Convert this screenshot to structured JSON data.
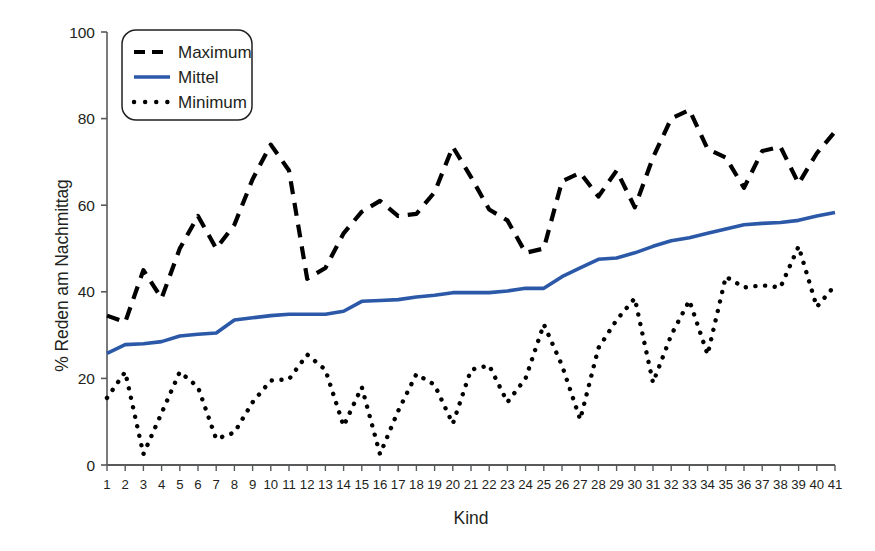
{
  "chart_data": {
    "type": "line",
    "title": "",
    "xlabel": "Kind",
    "ylabel": "% Reden am Nachmittag",
    "xlim": [
      1,
      41
    ],
    "ylim": [
      0,
      100
    ],
    "grid": false,
    "legend_position": "top-left",
    "x": [
      1,
      2,
      3,
      4,
      5,
      6,
      7,
      8,
      9,
      10,
      11,
      12,
      13,
      14,
      15,
      16,
      17,
      18,
      19,
      20,
      21,
      22,
      23,
      24,
      25,
      26,
      27,
      28,
      29,
      30,
      31,
      32,
      33,
      34,
      35,
      36,
      37,
      38,
      39,
      40,
      41
    ],
    "xtick_labels": [
      "1",
      "2",
      "3",
      "4",
      "5",
      "6",
      "7",
      "8",
      "9",
      "10",
      "11",
      "12",
      "13",
      "14",
      "15",
      "16",
      "17",
      "18",
      "19",
      "20",
      "21",
      "22",
      "23",
      "24",
      "25",
      "26",
      "27",
      "28",
      "29",
      "30",
      "31",
      "32",
      "33",
      "34",
      "35",
      "36",
      "37",
      "38",
      "39",
      "40",
      "41"
    ],
    "ytick_labels": [
      "0",
      "20",
      "40",
      "60",
      "80",
      "100"
    ],
    "ytick_values": [
      0,
      20,
      40,
      60,
      80,
      100
    ],
    "series": [
      {
        "name": "Maximum",
        "style": "dashed",
        "color": "#000000",
        "values": [
          34.5,
          33.0,
          45.0,
          38.5,
          50.0,
          57.5,
          50.0,
          55.5,
          66.0,
          74.0,
          68.0,
          43.0,
          45.5,
          53.5,
          58.5,
          61.0,
          57.5,
          58.0,
          63.0,
          73.5,
          66.5,
          59.0,
          56.5,
          49.0,
          50.0,
          65.5,
          67.5,
          62.0,
          68.0,
          59.5,
          71.0,
          80.0,
          82.0,
          73.0,
          71.0,
          64.0,
          72.5,
          73.5,
          65.0,
          72.0,
          77.0
        ]
      },
      {
        "name": "Mittel",
        "style": "solid",
        "color": "#2b59a8",
        "values": [
          25.8,
          27.8,
          28.0,
          28.5,
          29.8,
          30.2,
          30.5,
          33.5,
          34.0,
          34.5,
          34.8,
          34.8,
          34.8,
          35.5,
          37.8,
          38.0,
          38.2,
          38.8,
          39.2,
          39.8,
          39.8,
          39.8,
          40.2,
          40.8,
          40.8,
          43.5,
          45.5,
          47.5,
          47.8,
          49.0,
          50.5,
          51.8,
          52.5,
          53.5,
          54.5,
          55.5,
          55.8,
          56.0,
          56.5,
          57.5,
          58.3
        ]
      },
      {
        "name": "Minimum",
        "style": "dotted",
        "color": "#000000",
        "values": [
          15.5,
          21.5,
          2.5,
          12.0,
          21.5,
          18.0,
          6.0,
          7.5,
          14.5,
          19.5,
          19.8,
          25.5,
          22.0,
          9.0,
          18.0,
          2.5,
          12.5,
          21.0,
          18.5,
          9.5,
          22.0,
          23.0,
          14.5,
          20.0,
          32.5,
          23.0,
          10.5,
          27.0,
          33.5,
          38.5,
          19.0,
          30.0,
          38.0,
          25.5,
          43.5,
          41.0,
          41.5,
          41.0,
          50.5,
          36.5,
          41.5
        ]
      }
    ]
  },
  "legend": {
    "items": [
      {
        "label": "Maximum",
        "style": "dashed",
        "color": "#000000"
      },
      {
        "label": "Mittel",
        "style": "solid",
        "color": "#2b59a8"
      },
      {
        "label": "Minimum",
        "style": "dotted",
        "color": "#000000"
      }
    ]
  },
  "axes": {
    "y_title": "% Reden am Nachmittag",
    "x_title": "Kind"
  }
}
